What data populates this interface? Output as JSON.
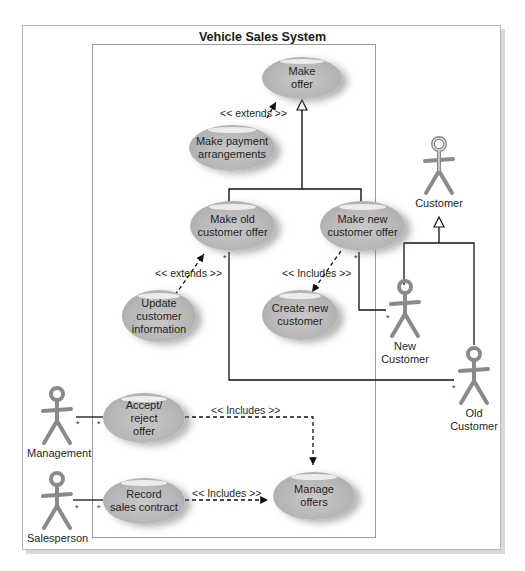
{
  "diagram": {
    "title": "Vehicle Sales System",
    "type": "UML use case diagram",
    "use_cases": [
      {
        "id": "make_offer",
        "label": "Make\noffer"
      },
      {
        "id": "make_payment",
        "label": "Make payment\narrangements"
      },
      {
        "id": "make_old_offer",
        "label": "Make old\ncustomer offer"
      },
      {
        "id": "make_new_offer",
        "label": "Make new\ncustomer offer"
      },
      {
        "id": "update_info",
        "label": "Update\ncustomer\ninformation"
      },
      {
        "id": "create_customer",
        "label": "Create new\ncustomer"
      },
      {
        "id": "accept_reject",
        "label": "Accept/\nreject\noffer"
      },
      {
        "id": "record_contract",
        "label": "Record\nsales contract"
      },
      {
        "id": "manage_offers",
        "label": "Manage\noffers"
      }
    ],
    "actors": [
      {
        "id": "customer",
        "label": "Customer"
      },
      {
        "id": "new_customer",
        "label": "New\nCustomer"
      },
      {
        "id": "old_customer",
        "label": "Old\nCustomer"
      },
      {
        "id": "management",
        "label": "Management"
      },
      {
        "id": "salesperson",
        "label": "Salesperson"
      }
    ],
    "relationship_labels": {
      "extends_payment": "<< extends >>",
      "extends_update": "<< extends >>",
      "includes_create": "<< Includes >>",
      "includes_accept": "<< Includes >>",
      "includes_record": "<< Includes >>"
    },
    "multiplicity": "*",
    "relationships": [
      {
        "from": "make_payment",
        "to": "make_offer",
        "type": "extends"
      },
      {
        "from": "make_old_offer",
        "to": "make_offer",
        "type": "generalization"
      },
      {
        "from": "make_new_offer",
        "to": "make_offer",
        "type": "generalization"
      },
      {
        "from": "update_info",
        "to": "make_old_offer",
        "type": "extends"
      },
      {
        "from": "make_new_offer",
        "to": "create_customer",
        "type": "includes"
      },
      {
        "from": "new_customer",
        "to": "customer",
        "type": "generalization"
      },
      {
        "from": "old_customer",
        "to": "customer",
        "type": "generalization"
      },
      {
        "from": "new_customer",
        "to": "make_new_offer",
        "type": "association"
      },
      {
        "from": "old_customer",
        "to": "make_old_offer",
        "type": "association"
      },
      {
        "from": "management",
        "to": "accept_reject",
        "type": "association"
      },
      {
        "from": "salesperson",
        "to": "record_contract",
        "type": "association"
      },
      {
        "from": "accept_reject",
        "to": "manage_offers",
        "type": "includes"
      },
      {
        "from": "record_contract",
        "to": "manage_offers",
        "type": "includes"
      }
    ]
  }
}
